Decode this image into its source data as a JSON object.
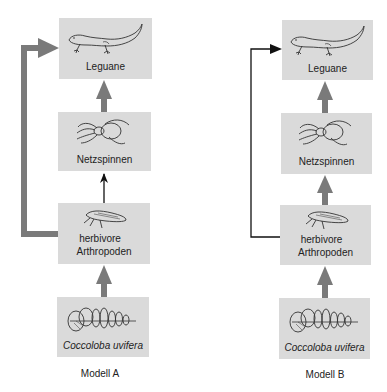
{
  "colors": {
    "box_fill": "#dadada",
    "thick_arrow": "#7a7a7a",
    "thin_arrow": "#111111",
    "text": "#222222"
  },
  "models": [
    {
      "caption": "Modell A",
      "nodes": [
        {
          "id": "leguane",
          "label": "Leguane",
          "icon": "lizard-icon"
        },
        {
          "id": "netzspinnen",
          "label": "Netzspinnen",
          "icon": "spider-icon"
        },
        {
          "id": "herbivore",
          "label_line1": "herbivore",
          "label_line2": "Arthropoden",
          "icon": "leafhopper-icon"
        },
        {
          "id": "coccoloba",
          "label": "Coccoloba uvifera",
          "icon": "seagrape-plant-icon"
        }
      ],
      "edges": [
        {
          "from": "coccoloba",
          "to": "herbivore",
          "style": "thick"
        },
        {
          "from": "herbivore",
          "to": "netzspinnen",
          "style": "thin"
        },
        {
          "from": "netzspinnen",
          "to": "leguane",
          "style": "thick"
        },
        {
          "from": "herbivore",
          "to": "leguane",
          "style": "thick",
          "route": "left-bypass"
        }
      ]
    },
    {
      "caption": "Modell B",
      "nodes": [
        {
          "id": "leguane",
          "label": "Leguane",
          "icon": "lizard-icon"
        },
        {
          "id": "netzspinnen",
          "label": "Netzspinnen",
          "icon": "spider-icon"
        },
        {
          "id": "herbivore",
          "label_line1": "herbivore",
          "label_line2": "Arthropoden",
          "icon": "leafhopper-icon"
        },
        {
          "id": "coccoloba",
          "label": "Coccoloba uvifera",
          "icon": "seagrape-plant-icon"
        }
      ],
      "edges": [
        {
          "from": "coccoloba",
          "to": "herbivore",
          "style": "thick"
        },
        {
          "from": "herbivore",
          "to": "netzspinnen",
          "style": "thick"
        },
        {
          "from": "netzspinnen",
          "to": "leguane",
          "style": "thick"
        },
        {
          "from": "herbivore",
          "to": "leguane",
          "style": "thin",
          "route": "left-bypass"
        }
      ]
    }
  ]
}
